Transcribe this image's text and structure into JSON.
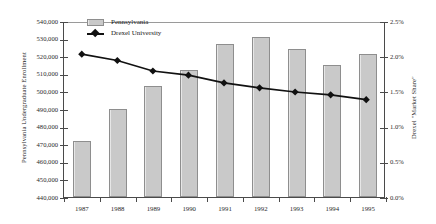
{
  "chart_data": {
    "type": "bar",
    "title": "",
    "xlabel": "",
    "ylabel": "Pennsylvania Undergraduate Enrollment",
    "y2label": "Drexel \"Market Share\"",
    "categories": [
      "1987",
      "1988",
      "1989",
      "1990",
      "1991",
      "1992",
      "1993",
      "1994",
      "1995"
    ],
    "ylim": [
      440000,
      540000
    ],
    "y2lim": [
      0.0,
      2.5
    ],
    "yticks": [
      "440,000",
      "450,000",
      "460,000",
      "470,000",
      "480,000",
      "490,000",
      "500,000",
      "510,000",
      "520,000",
      "530,000",
      "540,000"
    ],
    "ytick_values": [
      440000,
      450000,
      460000,
      470000,
      480000,
      490000,
      500000,
      510000,
      520000,
      530000,
      540000
    ],
    "y2ticks": [
      "0.0%",
      "0.5%",
      "1.0%",
      "1.5%",
      "2.0%",
      "2.5%"
    ],
    "y2tick_values": [
      0.0,
      0.5,
      1.0,
      1.5,
      2.0,
      2.5
    ],
    "grid": false,
    "legend_position": "top-left",
    "series": [
      {
        "name": "Pennsylvania",
        "type": "bar",
        "axis": "left",
        "color": "#c9c9c9",
        "values": [
          472000,
          490000,
          503000,
          512000,
          527000,
          531000,
          524000,
          515000,
          521000
        ]
      },
      {
        "name": "Drexel University",
        "type": "line",
        "axis": "right",
        "color": "#111111",
        "marker": "diamond",
        "values": [
          2.04,
          1.95,
          1.8,
          1.74,
          1.63,
          1.56,
          1.5,
          1.46,
          1.39
        ]
      }
    ]
  },
  "legend": {
    "items": [
      {
        "label": "Pennsylvania",
        "kind": "bar"
      },
      {
        "label": "Drexel University",
        "kind": "line"
      }
    ]
  }
}
